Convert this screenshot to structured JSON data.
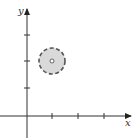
{
  "diagram": {
    "type": "coordinate-plane-punctured-disk",
    "axes": {
      "x_label": "x",
      "y_label": "y"
    },
    "x_ticks": [
      1,
      2,
      3
    ],
    "y_ticks": [
      1,
      2,
      3
    ],
    "region": {
      "shape": "disk",
      "boundary": "dashed",
      "fill": "#d9d9d9",
      "center": [
        1,
        2
      ],
      "center_point": "open"
    },
    "colors": {
      "axis": "#333333",
      "boundary": "#555555",
      "fill": "#d9d9d9"
    }
  }
}
